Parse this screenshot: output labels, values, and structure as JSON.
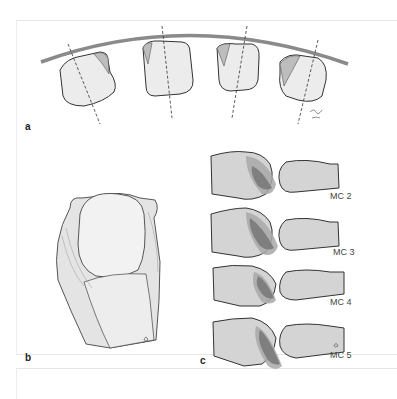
{
  "figure": {
    "panels": [
      {
        "id": "a",
        "label": "a",
        "description": "Metacarpal heads arranged along an arc with dashed axis lines"
      },
      {
        "id": "b",
        "label": "b",
        "description": "Metacarpophalangeal joint dorsal view with collateral ligaments"
      },
      {
        "id": "c",
        "label": "c",
        "description": "Lateral profiles of MC joints with contact area shading"
      }
    ],
    "mc_labels": [
      "MC 2",
      "MC 3",
      "MC 4",
      "MC 5"
    ],
    "signature": "Lang 2010",
    "colors": {
      "arc": "#8a8a8a",
      "bone_fill": "#d4d4d4",
      "contact_light": "#a8a8a8",
      "contact_dark": "#7a7a7a",
      "outline": "#333333"
    }
  }
}
